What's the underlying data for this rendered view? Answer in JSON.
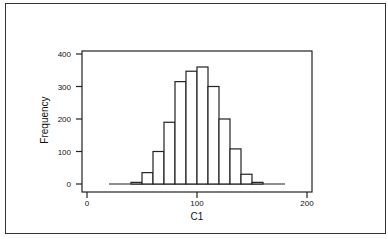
{
  "chart_data": {
    "type": "bar",
    "subtype": "histogram",
    "title": "",
    "xlabel": "C1",
    "ylabel": "Frequency",
    "bin_width": 10,
    "bin_edges": [
      40,
      50,
      60,
      70,
      80,
      90,
      100,
      110,
      120,
      130,
      140,
      150,
      160
    ],
    "categories": [
      "40-50",
      "50-60",
      "60-70",
      "70-80",
      "80-90",
      "90-100",
      "100-110",
      "110-120",
      "120-130",
      "130-140",
      "140-150",
      "150-160"
    ],
    "values": [
      5,
      35,
      100,
      190,
      315,
      347,
      360,
      300,
      200,
      108,
      30,
      5
    ],
    "xlim": [
      0,
      200
    ],
    "ylim": [
      0,
      400
    ],
    "xticks": [
      0,
      100,
      200
    ],
    "yticks": [
      0,
      100,
      200,
      300,
      400
    ],
    "baseline_range": [
      20,
      180
    ],
    "grid": false,
    "legend": null,
    "colors": {
      "bar_fill": "#ffffff",
      "bar_stroke": "#222222",
      "axis": "#222222"
    }
  }
}
